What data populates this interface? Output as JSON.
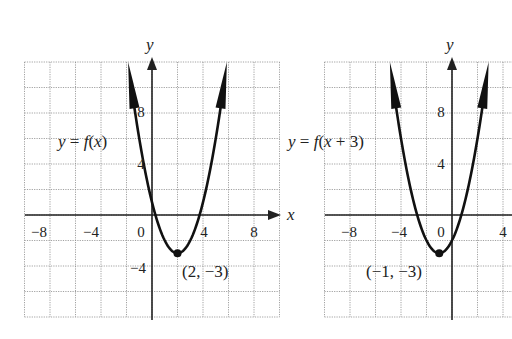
{
  "chart_data": [
    {
      "type": "line",
      "title": "",
      "series": [
        {
          "name": "y = f(x)",
          "function": "(x-2)^2-3",
          "vertex": [
            2,
            -3
          ]
        }
      ],
      "annotations": [
        {
          "text": "y = f(x)",
          "position": [
            -7.5,
            7
          ]
        },
        {
          "text": "(2, −3)",
          "point": [
            2,
            -3
          ]
        }
      ],
      "xlabel": "x",
      "ylabel": "y",
      "xlim": [
        -10,
        10
      ],
      "ylim": [
        -8,
        12
      ],
      "x_ticks": [
        -8,
        -4,
        0,
        4,
        8
      ],
      "y_ticks": [
        8,
        4,
        -4
      ],
      "grid": true
    },
    {
      "type": "line",
      "title": "",
      "series": [
        {
          "name": "y = f(x + 3)",
          "function": "(x+1)^2-3",
          "vertex": [
            -1,
            -3
          ]
        }
      ],
      "annotations": [
        {
          "text": "y = f(x + 3)",
          "position": [
            -12,
            7
          ]
        },
        {
          "text": "(−1, −3)",
          "point": [
            -1,
            -3
          ]
        }
      ],
      "xlabel": "",
      "ylabel": "y",
      "xlim": [
        -10,
        4.6
      ],
      "ylim": [
        -8,
        12
      ],
      "x_ticks": [
        -8,
        -4,
        0,
        4
      ],
      "y_ticks": [
        8,
        4
      ],
      "grid": true
    }
  ],
  "left": {
    "y_axis_label": "y",
    "x_axis_label": "x",
    "curve_label": "y = f(x)",
    "vertex_label": "(2, −3)",
    "x_ticks": [
      "−8",
      "−4",
      "0",
      "4",
      "8"
    ],
    "y_ticks": [
      "8",
      "4",
      "−4"
    ]
  },
  "right": {
    "y_axis_label": "y",
    "curve_label": "y = f(x + 3)",
    "vertex_label": "(−1, −3)",
    "x_ticks": [
      "−8",
      "−4",
      "0",
      "4"
    ],
    "y_ticks": [
      "8",
      "4"
    ]
  }
}
